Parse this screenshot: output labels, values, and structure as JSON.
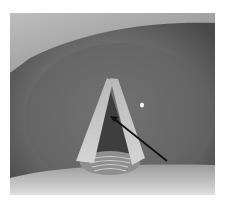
{
  "image": {
    "subject": "laryngoscopic view of vocal folds",
    "annotation": "arrow pointing to glottal opening",
    "colors": {
      "background": "#ffffff",
      "tissue_dark": "#5a5a5a",
      "tissue_mid": "#7d7d7d",
      "vocal_fold": "#c8c8c8",
      "glottis": "#3e3e3e",
      "arrow": "#111111",
      "scope_edge_light": "#d9d9d9"
    }
  }
}
